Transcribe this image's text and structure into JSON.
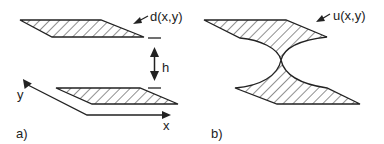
{
  "panel_a": {
    "label": "a)",
    "field_label": "d(x,y)",
    "gap_label": "h",
    "axis_x_label": "x",
    "axis_y_label": "y"
  },
  "panel_b": {
    "label": "b)",
    "field_label": "u(x,y)"
  },
  "colors": {
    "stroke": "#222222",
    "background": "#ffffff"
  }
}
